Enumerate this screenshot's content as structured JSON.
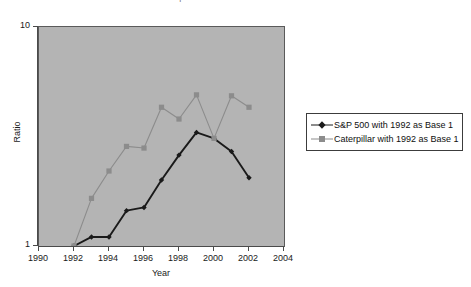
{
  "title_sliver": "S&P 500 Real Return vs. Caterpillar Real Return",
  "chart_data": {
    "type": "line",
    "title": "S&P 500 Real Return vs. Caterpillar Real Return",
    "xlabel": "Year",
    "ylabel": "Ratio",
    "x": [
      1992,
      1993,
      1994,
      1995,
      1996,
      1997,
      1998,
      1999,
      2000,
      2001,
      2002
    ],
    "xlim": [
      1990,
      2004
    ],
    "xticks": [
      "1990",
      "1992",
      "1994",
      "1996",
      "1998",
      "2000",
      "2002",
      "2004"
    ],
    "ylim": [
      1,
      10
    ],
    "yscale": "log",
    "yticks": [
      "1",
      "10"
    ],
    "grid": false,
    "legend_position": "right",
    "plot_background": "#b4b4b4",
    "series": [
      {
        "name": "S&P 500 with 1992 as Base 1",
        "color": "#1a1a1a",
        "marker": "diamond",
        "values": [
          1.0,
          1.1,
          1.1,
          1.45,
          1.5,
          2.0,
          2.6,
          3.3,
          3.1,
          2.7,
          2.05
        ]
      },
      {
        "name": "Caterpillar with 1992 as Base 1",
        "color": "#8c8c8c",
        "marker": "square",
        "values": [
          1.0,
          1.65,
          2.2,
          2.85,
          2.8,
          4.3,
          3.8,
          4.9,
          3.1,
          4.85,
          4.3
        ]
      }
    ]
  },
  "axes": {
    "y_title": "Ratio",
    "y_labels": [
      "10",
      "1"
    ],
    "x_title": "Year",
    "x_labels": [
      "1990",
      "1992",
      "1994",
      "1996",
      "1998",
      "2000",
      "2002",
      "2004"
    ]
  },
  "legend": {
    "items": [
      {
        "label": "S&P 500 with 1992 as Base 1",
        "marker": "diamond",
        "color": "#1a1a1a"
      },
      {
        "label": "Caterpillar with 1992 as Base 1",
        "marker": "square",
        "color": "#8c8c8c"
      }
    ]
  }
}
